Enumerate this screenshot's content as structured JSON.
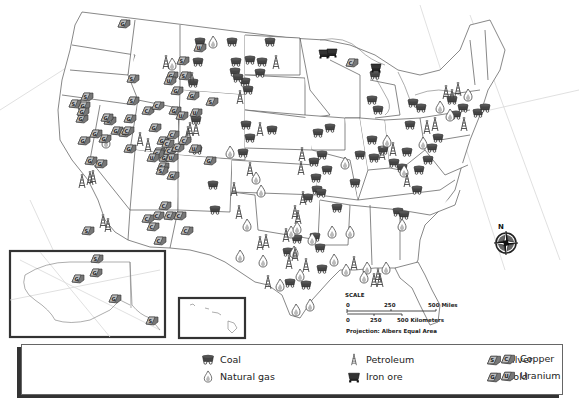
{
  "map": {
    "title": "Mineral and Energy Resources of the United States",
    "insets": [
      {
        "name": "Alaska",
        "box": [
          10,
          251,
          155,
          86
        ]
      },
      {
        "name": "Hawaii",
        "box": [
          179,
          298,
          66,
          40
        ]
      }
    ],
    "compass": {
      "label": "N",
      "x": 506,
      "y": 241
    },
    "scale": {
      "title": "SCALE",
      "miles": [
        "0",
        "250",
        "500 Miles"
      ],
      "kilometers": [
        "0",
        "250",
        "500 Kilometers"
      ],
      "projection": "Projection: Albers Equal Area"
    }
  },
  "legend": {
    "columns": [
      [
        {
          "key": "coal",
          "label": "Coal"
        },
        {
          "key": "gas",
          "label": "Natural gas"
        }
      ],
      [
        {
          "key": "petroleum",
          "label": "Petroleum"
        },
        {
          "key": "iron",
          "label": "Iron ore"
        }
      ],
      [
        {
          "key": "silver",
          "label": "Silver"
        },
        {
          "key": "gold",
          "label": "Gold"
        }
      ],
      [
        {
          "key": "copper",
          "label": "Copper"
        },
        {
          "key": "uranium",
          "label": "Uranium"
        }
      ]
    ]
  },
  "symbols": {
    "coal": [
      [
        200,
        42
      ],
      [
        232,
        42
      ],
      [
        270,
        42
      ],
      [
        198,
        62
      ],
      [
        236,
        62
      ],
      [
        262,
        62
      ],
      [
        235,
        72
      ],
      [
        260,
        73
      ],
      [
        245,
        82
      ],
      [
        193,
        83
      ],
      [
        248,
        90
      ],
      [
        196,
        120
      ],
      [
        246,
        125
      ],
      [
        272,
        130
      ],
      [
        250,
        138
      ],
      [
        243,
        153
      ],
      [
        197,
        150
      ],
      [
        213,
        185
      ],
      [
        215,
        210
      ],
      [
        238,
        78
      ],
      [
        250,
        60
      ],
      [
        375,
        75
      ],
      [
        372,
        100
      ],
      [
        378,
        110
      ],
      [
        372,
        140
      ],
      [
        383,
        150
      ],
      [
        374,
        158
      ],
      [
        360,
        155
      ],
      [
        330,
        128
      ],
      [
        318,
        133
      ],
      [
        322,
        155
      ],
      [
        314,
        162
      ],
      [
        327,
        170
      ],
      [
        316,
        178
      ],
      [
        317,
        190
      ],
      [
        321,
        193
      ],
      [
        308,
        198
      ],
      [
        337,
        208
      ],
      [
        355,
        183
      ],
      [
        394,
        163
      ],
      [
        402,
        168
      ],
      [
        407,
        152
      ],
      [
        410,
        125
      ],
      [
        413,
        103
      ],
      [
        421,
        108
      ],
      [
        456,
        115
      ],
      [
        452,
        100
      ],
      [
        463,
        108
      ],
      [
        478,
        113
      ],
      [
        485,
        108
      ],
      [
        438,
        138
      ],
      [
        432,
        148
      ],
      [
        428,
        160
      ],
      [
        419,
        170
      ],
      [
        417,
        190
      ],
      [
        398,
        212
      ],
      [
        404,
        215
      ],
      [
        297,
        239
      ],
      [
        315,
        237
      ],
      [
        320,
        248
      ],
      [
        288,
        252
      ],
      [
        290,
        283
      ],
      [
        322,
        269
      ],
      [
        306,
        285
      ]
    ],
    "gas": [
      [
        106,
        142
      ],
      [
        213,
        42
      ],
      [
        172,
        64
      ],
      [
        230,
        152
      ],
      [
        256,
        178
      ],
      [
        261,
        191
      ],
      [
        291,
        232
      ],
      [
        297,
        228
      ],
      [
        247,
        225
      ],
      [
        240,
        256
      ],
      [
        263,
        261
      ],
      [
        294,
        252
      ],
      [
        312,
        239
      ],
      [
        332,
        232
      ],
      [
        350,
        232
      ],
      [
        334,
        260
      ],
      [
        346,
        270
      ],
      [
        367,
        268
      ],
      [
        386,
        268
      ],
      [
        402,
        225
      ],
      [
        345,
        163
      ],
      [
        387,
        141
      ],
      [
        404,
        171
      ],
      [
        423,
        143
      ],
      [
        450,
        115
      ],
      [
        440,
        107
      ],
      [
        468,
        95
      ],
      [
        296,
        310
      ],
      [
        310,
        305
      ],
      [
        280,
        285
      ],
      [
        300,
        275
      ],
      [
        364,
        277
      ]
    ],
    "petroleum": [
      [
        166,
        63
      ],
      [
        192,
        80
      ],
      [
        276,
        63
      ],
      [
        240,
        98
      ],
      [
        196,
        130
      ],
      [
        260,
        130
      ],
      [
        250,
        170
      ],
      [
        239,
        213
      ],
      [
        234,
        190
      ],
      [
        301,
        169
      ],
      [
        302,
        155
      ],
      [
        303,
        199
      ],
      [
        295,
        213
      ],
      [
        298,
        218
      ],
      [
        286,
        236
      ],
      [
        266,
        242
      ],
      [
        260,
        244
      ],
      [
        289,
        263
      ],
      [
        295,
        255
      ],
      [
        306,
        266
      ],
      [
        268,
        283
      ],
      [
        354,
        264
      ],
      [
        380,
        281
      ],
      [
        374,
        281
      ],
      [
        378,
        276
      ],
      [
        382,
        154
      ],
      [
        393,
        150
      ],
      [
        435,
        125
      ],
      [
        427,
        128
      ],
      [
        446,
        93
      ],
      [
        464,
        125
      ],
      [
        407,
        181
      ],
      [
        458,
        90
      ],
      [
        452,
        97
      ],
      [
        190,
        130
      ],
      [
        188,
        134
      ],
      [
        82,
        182
      ],
      [
        93,
        178
      ],
      [
        103,
        222
      ],
      [
        108,
        226
      ],
      [
        148,
        146
      ],
      [
        140,
        140
      ],
      [
        90,
        179
      ]
    ],
    "iron": [
      [
        324,
        53
      ],
      [
        332,
        52
      ],
      [
        376,
        67
      ]
    ],
    "silver": [
      [
        87,
        96
      ],
      [
        110,
        120
      ],
      [
        75,
        103
      ],
      [
        97,
        258
      ],
      [
        152,
        320
      ],
      [
        88,
        230
      ],
      [
        212,
        101
      ],
      [
        183,
        60
      ],
      [
        185,
        75
      ],
      [
        133,
        100
      ],
      [
        163,
        166
      ],
      [
        162,
        170
      ],
      [
        133,
        78
      ]
    ],
    "gold": [
      [
        124,
        23
      ],
      [
        82,
        118
      ],
      [
        84,
        105
      ],
      [
        107,
        117
      ],
      [
        105,
        138
      ],
      [
        117,
        130
      ],
      [
        125,
        132
      ],
      [
        130,
        118
      ],
      [
        175,
        110
      ],
      [
        177,
        90
      ],
      [
        172,
        75
      ],
      [
        83,
        111
      ],
      [
        84,
        140
      ],
      [
        91,
        160
      ],
      [
        101,
        163
      ],
      [
        130,
        148
      ],
      [
        159,
        151
      ],
      [
        96,
        133
      ],
      [
        210,
        160
      ],
      [
        163,
        140
      ],
      [
        173,
        175
      ],
      [
        78,
        278
      ],
      [
        115,
        298
      ],
      [
        96,
        272
      ],
      [
        193,
        95
      ],
      [
        155,
        127
      ],
      [
        165,
        157
      ]
    ],
    "copper": [
      [
        128,
        130
      ],
      [
        148,
        110
      ],
      [
        158,
        105
      ],
      [
        158,
        153
      ],
      [
        173,
        134
      ],
      [
        170,
        150
      ],
      [
        178,
        147
      ],
      [
        168,
        143
      ],
      [
        185,
        140
      ],
      [
        170,
        215
      ],
      [
        180,
        215
      ],
      [
        160,
        240
      ],
      [
        153,
        226
      ],
      [
        158,
        215
      ],
      [
        187,
        230
      ],
      [
        165,
        205
      ],
      [
        148,
        218
      ],
      [
        352,
        62
      ]
    ],
    "uranium": [
      [
        200,
        47
      ],
      [
        170,
        80
      ],
      [
        153,
        157
      ],
      [
        172,
        157
      ],
      [
        196,
        112
      ],
      [
        182,
        115
      ],
      [
        195,
        148
      ]
    ]
  }
}
